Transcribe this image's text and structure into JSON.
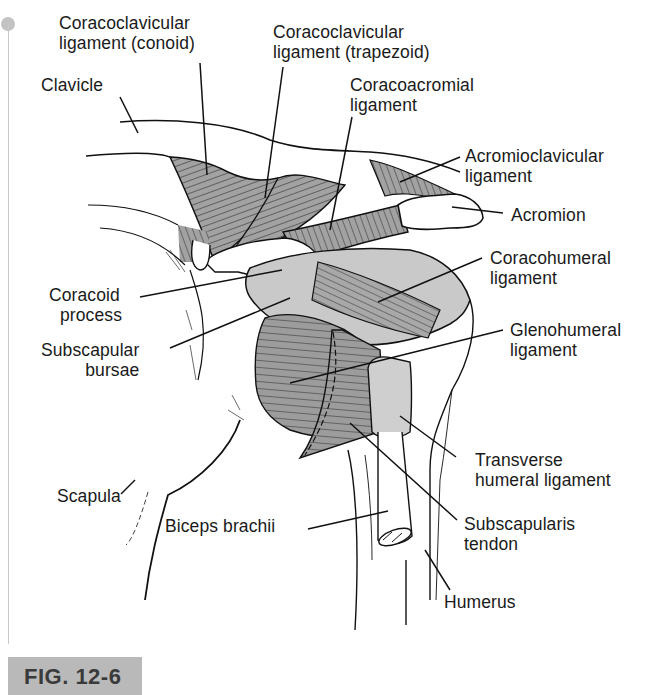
{
  "figure": {
    "label": "FIG. 12-6"
  },
  "colors": {
    "ligament_fill": "#9a9a9a",
    "bursa_fill": "#c9c9c9",
    "bone_fill": "#ffffff",
    "line": "#111111",
    "fig_tag_bg": "#b9b9b9",
    "fig_tag_text": "#3a3a3a",
    "margin_mark": "#c3c3c3"
  },
  "labels": {
    "conoid": {
      "line1": "Coracoclavicular",
      "line2": "ligament (conoid)"
    },
    "trapezoid": {
      "line1": "Coracoclavicular",
      "line2": "ligament (trapezoid)"
    },
    "clavicle": {
      "line1": "Clavicle"
    },
    "coracoacromial": {
      "line1": "Coracoacromial",
      "line2": "ligament"
    },
    "acromioclavicular": {
      "line1": "Acromioclavicular",
      "line2": "ligament"
    },
    "acromion": {
      "line1": "Acromion"
    },
    "coracohumeral": {
      "line1": "Coracohumeral",
      "line2": "ligament"
    },
    "coracoid": {
      "line1": "Coracoid",
      "line2": "process"
    },
    "glenohumeral": {
      "line1": "Glenohumeral",
      "line2": "ligament"
    },
    "subscapular_bursae": {
      "line1": "Subscapular",
      "line2": "bursae"
    },
    "transverse_humeral": {
      "line1": "Transverse",
      "line2": "humeral ligament"
    },
    "scapula": {
      "line1": "Scapula"
    },
    "biceps": {
      "line1": "Biceps brachii"
    },
    "subscapularis": {
      "line1": "Subscapularis",
      "line2": "tendon"
    },
    "humerus": {
      "line1": "Humerus"
    }
  }
}
